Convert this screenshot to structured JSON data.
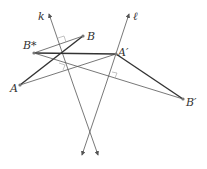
{
  "diagram": {
    "type": "geometry-reflection",
    "lines": [
      {
        "name": "k",
        "label": "k",
        "from": [
          49,
          14
        ],
        "to": [
          98,
          155
        ]
      },
      {
        "name": "l",
        "label": "ℓ",
        "from": [
          129,
          14
        ],
        "to": [
          82,
          155
        ]
      }
    ],
    "points": [
      {
        "name": "B",
        "label": "B",
        "x": 83,
        "y": 36
      },
      {
        "name": "B-star",
        "label": "B*",
        "x": 34,
        "y": 53
      },
      {
        "name": "A-prime",
        "label": "A′",
        "x": 116,
        "y": 54
      },
      {
        "name": "A",
        "label": "A",
        "x": 20,
        "y": 85
      },
      {
        "name": "B-prime",
        "label": "B′",
        "x": 183,
        "y": 99
      }
    ],
    "segments": [
      {
        "from": "A",
        "to": "B",
        "weight": "bold"
      },
      {
        "from": "A",
        "to": "A-prime",
        "weight": "normal"
      },
      {
        "from": "B-star",
        "to": "B",
        "weight": "normal"
      },
      {
        "from": "B-star",
        "to": "A-prime",
        "weight": "bold"
      },
      {
        "from": "B-star",
        "to": "B-prime",
        "weight": "normal"
      },
      {
        "from": "A-prime",
        "to": "B-prime",
        "weight": "bold"
      }
    ],
    "colors": {
      "line": "#555555",
      "bold": "#333333",
      "point": "#777777"
    }
  }
}
